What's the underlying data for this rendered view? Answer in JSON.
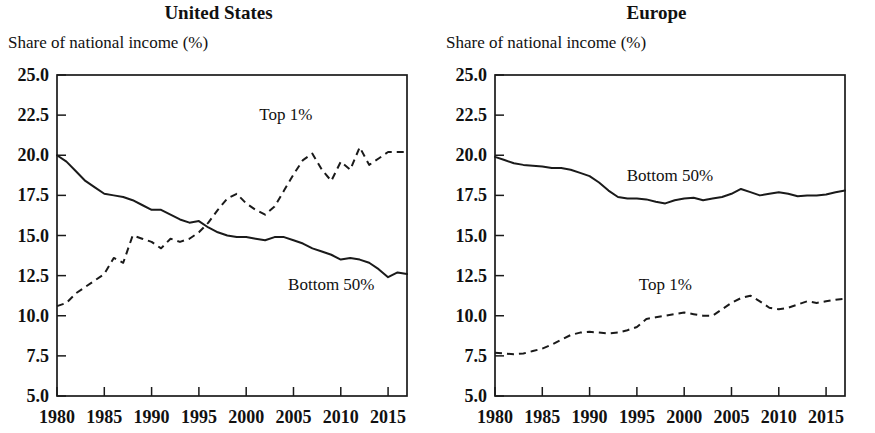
{
  "figure": {
    "width": 875,
    "height": 433,
    "background": "#ffffff",
    "ink_color": "#1a1a1a"
  },
  "panels": [
    {
      "id": "us",
      "title": "United States",
      "axis_label": "Share of national income (%)",
      "series_labels": {
        "top": "Top 1%",
        "bottom": "Bottom 50%"
      }
    },
    {
      "id": "eu",
      "title": "Europe",
      "axis_label": "Share of national income (%)",
      "series_labels": {
        "top": "Top 1%",
        "bottom": "Bottom 50%"
      }
    }
  ],
  "chart_data": [
    {
      "type": "line",
      "title": "United States",
      "xlabel": "",
      "ylabel": "Share of national income (%)",
      "xlim": [
        1980,
        2017
      ],
      "ylim": [
        5.0,
        25.0
      ],
      "ytick_labels": [
        "5.0",
        "7.5",
        "10.0",
        "12.5",
        "15.0",
        "17.5",
        "20.0",
        "22.5",
        "25.0"
      ],
      "yticks": [
        5.0,
        7.5,
        10.0,
        12.5,
        15.0,
        17.5,
        20.0,
        22.5,
        25.0
      ],
      "xtick_labels": [
        "1980",
        "1985",
        "1990",
        "1995",
        "2000",
        "2005",
        "2010",
        "2015"
      ],
      "xticks": [
        1980,
        1985,
        1990,
        1995,
        2000,
        2005,
        2010,
        2015
      ],
      "grid": false,
      "legend": "inline-annotations",
      "x": [
        1980,
        1981,
        1982,
        1983,
        1984,
        1985,
        1986,
        1987,
        1988,
        1989,
        1990,
        1991,
        1992,
        1993,
        1994,
        1995,
        1996,
        1997,
        1998,
        1999,
        2000,
        2001,
        2002,
        2003,
        2004,
        2005,
        2006,
        2007,
        2008,
        2009,
        2010,
        2011,
        2012,
        2013,
        2014,
        2015,
        2016,
        2017
      ],
      "series": [
        {
          "name": "Top 1%",
          "style": "dashed",
          "values": [
            10.6,
            10.8,
            11.4,
            11.8,
            12.2,
            12.6,
            13.6,
            13.3,
            15.0,
            14.8,
            14.6,
            14.2,
            14.8,
            14.6,
            14.8,
            15.2,
            15.8,
            16.6,
            17.3,
            17.6,
            17.0,
            16.6,
            16.3,
            16.8,
            17.8,
            18.8,
            19.7,
            20.1,
            19.1,
            18.4,
            19.6,
            19.1,
            20.5,
            19.4,
            19.8,
            20.2,
            20.2,
            20.2
          ]
        },
        {
          "name": "Bottom 50%",
          "style": "solid",
          "values": [
            20.0,
            19.6,
            19.0,
            18.4,
            18.0,
            17.6,
            17.5,
            17.4,
            17.2,
            16.9,
            16.6,
            16.6,
            16.3,
            16.0,
            15.8,
            15.9,
            15.5,
            15.2,
            15.0,
            14.9,
            14.9,
            14.8,
            14.7,
            14.9,
            14.9,
            14.7,
            14.5,
            14.2,
            14.0,
            13.8,
            13.5,
            13.6,
            13.5,
            13.3,
            12.9,
            12.4,
            12.7,
            12.6
          ]
        }
      ]
    },
    {
      "type": "line",
      "title": "Europe",
      "xlabel": "",
      "ylabel": "Share of national income (%)",
      "xlim": [
        1980,
        2017
      ],
      "ylim": [
        5.0,
        25.0
      ],
      "ytick_labels": [
        "5.0",
        "7.5",
        "10.0",
        "12.5",
        "15.0",
        "17.5",
        "20.0",
        "22.5",
        "25.0"
      ],
      "yticks": [
        5.0,
        7.5,
        10.0,
        12.5,
        15.0,
        17.5,
        20.0,
        22.5,
        25.0
      ],
      "xtick_labels": [
        "1980",
        "1985",
        "1990",
        "1995",
        "2000",
        "2005",
        "2010",
        "2015"
      ],
      "xticks": [
        1980,
        1985,
        1990,
        1995,
        2000,
        2005,
        2010,
        2015
      ],
      "grid": false,
      "legend": "inline-annotations",
      "x": [
        1980,
        1981,
        1982,
        1983,
        1984,
        1985,
        1986,
        1987,
        1988,
        1989,
        1990,
        1991,
        1992,
        1993,
        1994,
        1995,
        1996,
        1997,
        1998,
        1999,
        2000,
        2001,
        2002,
        2003,
        2004,
        2005,
        2006,
        2007,
        2008,
        2009,
        2010,
        2011,
        2012,
        2013,
        2014,
        2015,
        2016,
        2017
      ],
      "series": [
        {
          "name": "Top 1%",
          "style": "dashed",
          "values": [
            7.7,
            7.65,
            7.6,
            7.65,
            7.8,
            7.95,
            8.2,
            8.5,
            8.8,
            8.95,
            9.0,
            8.95,
            8.9,
            8.95,
            9.1,
            9.3,
            9.8,
            9.9,
            10.0,
            10.1,
            10.2,
            10.1,
            10.0,
            10.0,
            10.4,
            10.8,
            11.1,
            11.25,
            10.9,
            10.5,
            10.4,
            10.5,
            10.7,
            10.9,
            10.8,
            10.9,
            11.0,
            11.05
          ]
        },
        {
          "name": "Bottom 50%",
          "style": "solid",
          "values": [
            19.9,
            19.7,
            19.5,
            19.4,
            19.35,
            19.3,
            19.2,
            19.2,
            19.1,
            18.9,
            18.7,
            18.3,
            17.8,
            17.4,
            17.3,
            17.3,
            17.25,
            17.1,
            17.0,
            17.2,
            17.3,
            17.35,
            17.2,
            17.3,
            17.4,
            17.6,
            17.9,
            17.7,
            17.5,
            17.6,
            17.7,
            17.6,
            17.45,
            17.5,
            17.5,
            17.55,
            17.7,
            17.8
          ]
        }
      ]
    }
  ],
  "annotations": {
    "us_top_label": {
      "text": "Top 1%",
      "x_year": 2004.2,
      "y_value": 22.2
    },
    "us_bottom_label": {
      "text": "Bottom 50%",
      "x_year": 2009.0,
      "y_value": 11.6
    },
    "eu_top_label": {
      "text": "Top 1%",
      "x_year": 1998.0,
      "y_value": 11.6
    },
    "eu_bottom_label": {
      "text": "Bottom 50%",
      "x_year": 1998.5,
      "y_value": 18.4
    }
  }
}
